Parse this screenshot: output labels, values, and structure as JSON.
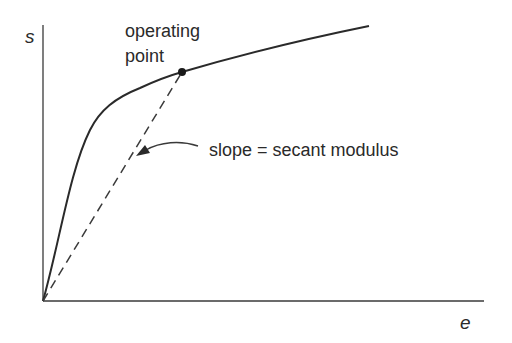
{
  "diagram": {
    "axes": {
      "y_label": "s",
      "x_label": "e"
    },
    "annotations": {
      "operating_point_line1": "operating",
      "operating_point_line2": "point",
      "slope_label": "slope = secant modulus"
    },
    "elements": {
      "curve": "nonlinear stress-strain curve, steep initial rise, bending over into a gently sloping upper branch",
      "secant_line": "dashed line from origin to operating point",
      "operating_point": "filled dot on the curve",
      "arrow": "curved arrow pointing from slope label to the dashed secant line"
    },
    "colors": {
      "stroke": "#2a2a2a",
      "background": "#ffffff"
    }
  }
}
